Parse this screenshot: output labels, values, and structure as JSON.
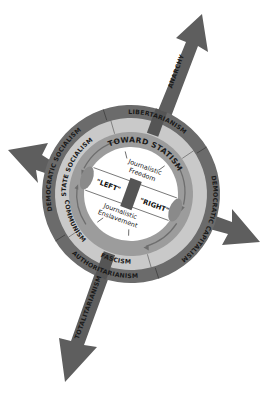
{
  "diagram": {
    "type": "political-spectrum-wheel",
    "axes": {
      "up_arrow": "ANARCHY",
      "down_arrow": "TOTALITARIANISM"
    },
    "outer_ring": {
      "top": "LIBERTARIANISM",
      "bottom": "AUTHORITARIANISM",
      "left": "DEMOCRATIC SOCIALISM",
      "right": "DEMOCRATIC CAPITALISM"
    },
    "inner_ring": {
      "left": "STATE SOCIALISM",
      "bottom_left": "COMMUNISM",
      "bottom": "FASCISM"
    },
    "track_label": "TOWARD STATISM",
    "center": {
      "top_line1": "Journalistic",
      "top_line2": "Freedom",
      "left": "\"LEFT\"",
      "right": "\"RIGHT\"",
      "bottom_line1": "Journalistic",
      "bottom_line2": "Enslavement"
    },
    "colors": {
      "outer_ring": "#6b6b6b",
      "inner_ring": "#c9c9c9",
      "track": "#9c9c9c",
      "arrow": "#5e5e5e",
      "center": "#ffffff",
      "text": "#1a1a1a"
    }
  }
}
